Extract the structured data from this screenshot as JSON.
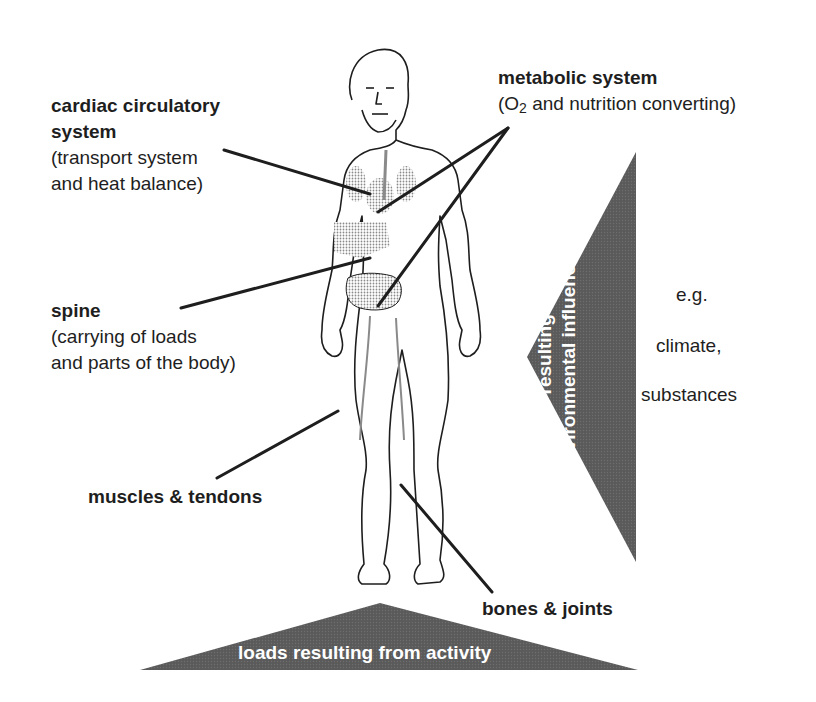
{
  "diagram": {
    "colors": {
      "triangle_fill": "#5a5a5a",
      "leader_line": "#1e1e1e",
      "organ_shading": "#9a9a9a",
      "text": "#1e1e1e",
      "triangle_text": "#ffffff"
    },
    "labels": {
      "cardiac": {
        "title_line1": "cardiac circulatory",
        "title_line2": "system",
        "desc_line1": "(transport system",
        "desc_line2": "and heat balance)"
      },
      "metabolic": {
        "title": "metabolic system",
        "desc_prefix": "(O",
        "desc_sub": "2",
        "desc_suffix": " and nutrition converting)"
      },
      "spine": {
        "title": "spine",
        "desc_line1": "(carrying of loads",
        "desc_line2": "and parts of the body)"
      },
      "muscles": {
        "title": "muscles & tendons"
      },
      "bones": {
        "title": "bones & joints"
      }
    },
    "environment_triangle": {
      "text_line1": "loads resulting from",
      "text_line2": "environmental influences",
      "examples": [
        "e.g.",
        "climate,",
        "substances"
      ]
    },
    "activity_triangle": {
      "text": "loads resulting from activity"
    }
  }
}
